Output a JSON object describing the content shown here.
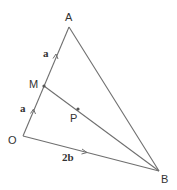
{
  "diagram": {
    "points": {
      "A": {
        "label": "A"
      },
      "M": {
        "label": "M"
      },
      "O": {
        "label": "O"
      },
      "B": {
        "label": "B"
      },
      "P": {
        "label": "P"
      }
    },
    "vectors": {
      "OM": {
        "label": "a"
      },
      "MA": {
        "label": "a"
      },
      "OB": {
        "label": "2b"
      }
    },
    "segments": [
      "OA",
      "AB",
      "OB",
      "MB"
    ],
    "colors": {
      "line": "#6f6f6f",
      "point": "#555555",
      "text": "#333333"
    }
  }
}
